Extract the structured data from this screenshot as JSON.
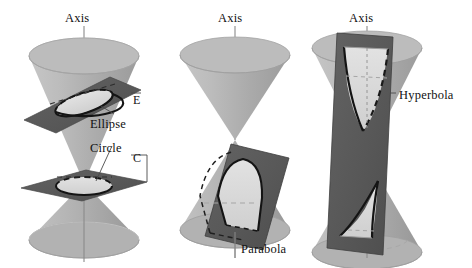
{
  "figure": {
    "width": 472,
    "height": 268,
    "background": "#ffffff"
  },
  "colors": {
    "cone_light": "#bdbdbd",
    "cone_mid": "#a9a9a9",
    "cone_dark": "#9a9a9a",
    "cone_shadow": "#8f8f8f",
    "plane_dark": "#595959",
    "plane_edge": "#3d3d3d",
    "section_fill": "#d8d8d8",
    "section_fill_light": "#dedede",
    "outline": "#1a1a1a",
    "axis_line": "#8a8a8a",
    "leader_line": "#4a4a4a",
    "text": "#111111"
  },
  "panels": [
    {
      "id": "panel-ellipse-circle",
      "name": "ellipse-and-circle-panel",
      "axis_label": "Axis",
      "axis_label_pos": {
        "x": 65,
        "y": 12
      },
      "labels": [
        {
          "id": "ellipse-label",
          "text": "Ellipse",
          "x": 90,
          "y": 118
        },
        {
          "id": "circle-label",
          "text": "Circle",
          "x": 90,
          "y": 142
        },
        {
          "id": "plane-e-label",
          "text": "E",
          "x": 133,
          "y": 94
        },
        {
          "id": "plane-c-label",
          "text": "C",
          "x": 133,
          "y": 152
        }
      ],
      "conic_types": [
        "ellipse",
        "circle"
      ]
    },
    {
      "id": "panel-parabola",
      "name": "parabola-panel",
      "axis_label": "Axis",
      "axis_label_pos": {
        "x": 218,
        "y": 12
      },
      "labels": [
        {
          "id": "parabola-label",
          "text": "Parabola",
          "x": 241,
          "y": 243
        }
      ],
      "conic_types": [
        "parabola"
      ]
    },
    {
      "id": "panel-hyperbola",
      "name": "hyperbola-panel",
      "axis_label": "Axis",
      "axis_label_pos": {
        "x": 349,
        "y": 12
      },
      "labels": [
        {
          "id": "hyperbola-label",
          "text": "Hyperbola",
          "x": 399,
          "y": 89
        }
      ],
      "conic_types": [
        "hyperbola"
      ]
    }
  ],
  "legend_terms": [
    "Axis",
    "Ellipse",
    "Circle",
    "E",
    "C",
    "Parabola",
    "Hyperbola"
  ]
}
